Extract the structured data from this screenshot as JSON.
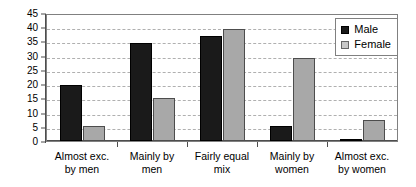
{
  "chart_data": {
    "type": "bar",
    "title": "",
    "xlabel": "",
    "ylabel": "",
    "ylim": [
      0,
      45
    ],
    "ytick_step": 5,
    "yticks": [
      45,
      40,
      35,
      30,
      25,
      20,
      15,
      10,
      5,
      0
    ],
    "grid": true,
    "legend_position": "top-right",
    "categories": [
      "Almost exc.\nby men",
      "Mainly by\nmen",
      "Fairly equal\nmix",
      "Mainly by\nwomen",
      "Almost exc.\nby women"
    ],
    "series": [
      {
        "name": "Male",
        "color": "#1a1a1a",
        "values": [
          20.5,
          35,
          37.5,
          6,
          1
        ]
      },
      {
        "name": "Female",
        "color": "#a8a8a8",
        "values": [
          6,
          16,
          40,
          30,
          8
        ]
      }
    ]
  },
  "legend": {
    "items": [
      {
        "label": "Male",
        "swatch": "male-swatch-icon"
      },
      {
        "label": "Female",
        "swatch": "female-swatch-icon"
      }
    ]
  },
  "colors": {
    "male": "#1a1a1a",
    "female": "#a8a8a8",
    "gridline": "#b0b0b0",
    "axis": "#4d4d4d",
    "frame": "#808080",
    "background": "#ffffff"
  }
}
